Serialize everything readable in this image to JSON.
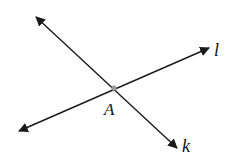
{
  "diagram": {
    "type": "intersecting-lines",
    "point": {
      "label": "A",
      "x": 114,
      "y": 88,
      "color": "#999999"
    },
    "lines": [
      {
        "name": "k",
        "label": "k",
        "x1": 36,
        "y1": 17,
        "x2": 177,
        "y2": 148
      },
      {
        "name": "l",
        "label": "l",
        "x1": 19,
        "y1": 131,
        "x2": 209,
        "y2": 48
      }
    ],
    "line_color": "#1a1a1a"
  }
}
